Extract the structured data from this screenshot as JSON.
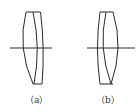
{
  "diagram": {
    "type": "cemented doublet lenses",
    "stroke_color": "#2b2b2b",
    "figures": [
      {
        "id": "a",
        "label": "（a）"
      },
      {
        "id": "b",
        "label": "（b）"
      }
    ]
  }
}
